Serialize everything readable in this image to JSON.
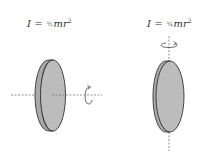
{
  "diagram": {
    "left": {
      "formula": {
        "symbol": "I",
        "equals": "=",
        "fraction": "½",
        "mass": "m",
        "radius": "r",
        "exponent": "2"
      },
      "description": "Disk rotating about central axis perpendicular to face"
    },
    "right": {
      "formula": {
        "symbol": "I",
        "equals": "=",
        "fraction": "¼",
        "mass": "m",
        "radius": "r",
        "exponent": "2"
      },
      "description": "Disk rotating about a diameter"
    },
    "colors": {
      "disk_fill": "#b8b8b8",
      "disk_outline": "#333333",
      "axis": "#777777",
      "text": "#333333"
    }
  }
}
